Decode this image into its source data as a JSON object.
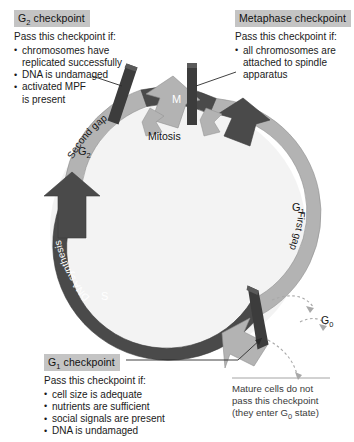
{
  "colors": {
    "ring_light": "#b3b3b3",
    "ring_dark": "#4a4a4a",
    "checkpoint_bar": "#3c3c3c",
    "header_highlight": "#c4c4c4",
    "background": "#ffffff",
    "note_text": "#3a3a3a",
    "dotted_arrow": "#a8a8a8"
  },
  "checkpoints": {
    "g2": {
      "header": "G2 checkpoint",
      "header_main": "G",
      "header_sub": "2",
      "header_rest": " checkpoint",
      "lead": "Pass this checkpoint if:",
      "items": [
        "chromosomes have\nreplicated successfully",
        "DNA is undamaged",
        "activated MPF\nis present"
      ]
    },
    "metaphase": {
      "header": "Metaphase checkpoint",
      "lead": "Pass this checkpoint if:",
      "items": [
        "all chromosomes are\nattached to spindle\napparatus"
      ]
    },
    "g1": {
      "header": "G1 checkpoint",
      "header_main": "G",
      "header_sub": "1",
      "header_rest": " checkpoint",
      "lead": "Pass this checkpoint if:",
      "items": [
        "cell size is adequate",
        "nutrients are sufficient",
        "social signals are present",
        "DNA is undamaged"
      ]
    }
  },
  "note": {
    "line1": "Mature cells do not",
    "line2": "pass this checkpoint",
    "line3_pre": "(they enter G",
    "line3_sub": "0",
    "line3_post": " state)"
  },
  "ring": {
    "phases": [
      {
        "symbol": "G",
        "sub": "1",
        "name": "First gap",
        "tone": "light"
      },
      {
        "symbol": "S",
        "sub": "",
        "name": "DNA synthesis",
        "tone": "dark"
      },
      {
        "symbol": "G",
        "sub": "2",
        "name": "Second gap",
        "tone": "light"
      },
      {
        "symbol": "M",
        "sub": "",
        "name": "Mitosis",
        "tone": "dark"
      }
    ],
    "g1_symbol": "G",
    "g1_sub": "1",
    "g1_name": "First gap",
    "s_symbol": "S",
    "s_name": "DNA synthesis",
    "g2_symbol": "G",
    "g2_sub": "2",
    "g2_name": "Second gap",
    "m_symbol": "M",
    "m_name": "Mitosis",
    "g0_symbol": "G",
    "g0_sub": "0"
  }
}
